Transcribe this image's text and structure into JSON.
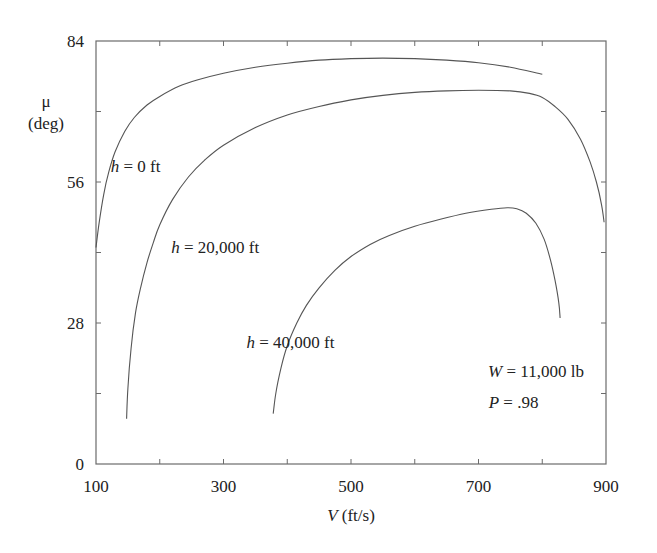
{
  "chart_data": {
    "type": "line",
    "title": "",
    "xlabel": "V (ft/s)",
    "xlabel_var": "V",
    "xlabel_unit": " (ft/s)",
    "ylabel_symbol": "μ",
    "ylabel_unit": "(deg)",
    "xlim": [
      100,
      900
    ],
    "ylim": [
      0,
      84
    ],
    "x_ticks": [
      100,
      200,
      300,
      400,
      500,
      600,
      700,
      800,
      900
    ],
    "x_tick_labels": [
      "100",
      "300",
      "500",
      "700",
      "900"
    ],
    "x_tick_label_values": [
      100,
      300,
      500,
      700,
      900
    ],
    "y_ticks": [
      0,
      14,
      28,
      42,
      56,
      70,
      84
    ],
    "y_tick_labels": [
      "0",
      "28",
      "56",
      "84"
    ],
    "y_tick_label_values": [
      0,
      28,
      56,
      84
    ],
    "grid": false,
    "legend": "inline labels",
    "series": [
      {
        "name": "h = 0 ft",
        "label_var": "h",
        "label_rest": " = 0 ft",
        "label_pos": [
          123,
          58
        ],
        "x": [
          100,
          105,
          112,
          120,
          130,
          145,
          160,
          180,
          200,
          230,
          260,
          300,
          350,
          400,
          450,
          500,
          550,
          600,
          650,
          700,
          750,
          800
        ],
        "y": [
          43,
          48,
          53.5,
          58,
          62,
          66,
          68.8,
          71.3,
          73,
          75,
          76.3,
          77.6,
          78.8,
          79.6,
          80.2,
          80.5,
          80.6,
          80.5,
          80.2,
          79.7,
          78.8,
          77.4
        ]
      },
      {
        "name": "h = 20,000 ft",
        "label_var": "h",
        "label_rest": " = 20,000 ft",
        "label_pos": [
          218,
          42
        ],
        "x": [
          148,
          150,
          155,
          162,
          170,
          180,
          190,
          200,
          220,
          245,
          270,
          300,
          350,
          400,
          450,
          500,
          550,
          600,
          650,
          700,
          750,
          780,
          800,
          820,
          840,
          860,
          875,
          885,
          893,
          897
        ],
        "y": [
          9,
          15,
          23,
          30,
          35,
          40,
          44,
          47.5,
          52.5,
          57,
          60.3,
          63.3,
          66.8,
          69.3,
          71,
          72.3,
          73.2,
          73.8,
          74.1,
          74.2,
          74.1,
          73.6,
          72.8,
          71,
          68.5,
          64.5,
          60,
          56,
          51.5,
          48
        ]
      },
      {
        "name": "h = 40,000 ft",
        "label_var": "h",
        "label_rest": " = 40,000 ft",
        "label_pos": [
          336,
          23
        ],
        "x": [
          378,
          382,
          390,
          400,
          415,
          430,
          450,
          475,
          500,
          530,
          560,
          600,
          640,
          680,
          720,
          745,
          760,
          775,
          790,
          803,
          813,
          820,
          826,
          828
        ],
        "y": [
          10,
          14,
          19,
          23.5,
          28,
          31.5,
          35,
          38.5,
          41.2,
          43.6,
          45.4,
          47.2,
          48.6,
          49.8,
          50.6,
          50.9,
          50.7,
          49.8,
          47.8,
          44.6,
          40.5,
          36.5,
          32,
          29
        ]
      }
    ],
    "annotations": [
      {
        "var": "W",
        "rest": " = 11,000 lb",
        "pos": [
          715,
          17.2
        ]
      },
      {
        "var": "P",
        "rest": " = .98",
        "pos": [
          716,
          11.2
        ]
      }
    ]
  }
}
